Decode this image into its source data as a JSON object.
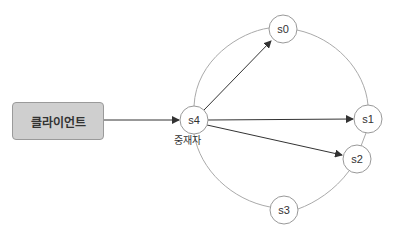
{
  "diagram": {
    "client": {
      "label": "클라이언트",
      "fill": "#cfcfcf"
    },
    "proxy": {
      "label": "중재자"
    },
    "nodes": [
      {
        "id": "s0",
        "label": "s0",
        "cx": 283,
        "cy": 29
      },
      {
        "id": "s1",
        "label": "s1",
        "cx": 368,
        "cy": 119
      },
      {
        "id": "s2",
        "label": "s2",
        "cx": 357,
        "cy": 159
      },
      {
        "id": "s3",
        "label": "s3",
        "cx": 284,
        "cy": 210
      },
      {
        "id": "s4",
        "label": "s4",
        "cx": 194,
        "cy": 120
      }
    ],
    "edges": [
      {
        "from": "client",
        "to": "s4",
        "arrow": true
      },
      {
        "from": "s4",
        "to": "s0",
        "arrow": true
      },
      {
        "from": "s4",
        "to": "s1",
        "arrow": true
      },
      {
        "from": "s4",
        "to": "s2",
        "arrow": true
      }
    ],
    "ring": [
      "s0",
      "s1",
      "s2",
      "s3",
      "s4"
    ]
  }
}
